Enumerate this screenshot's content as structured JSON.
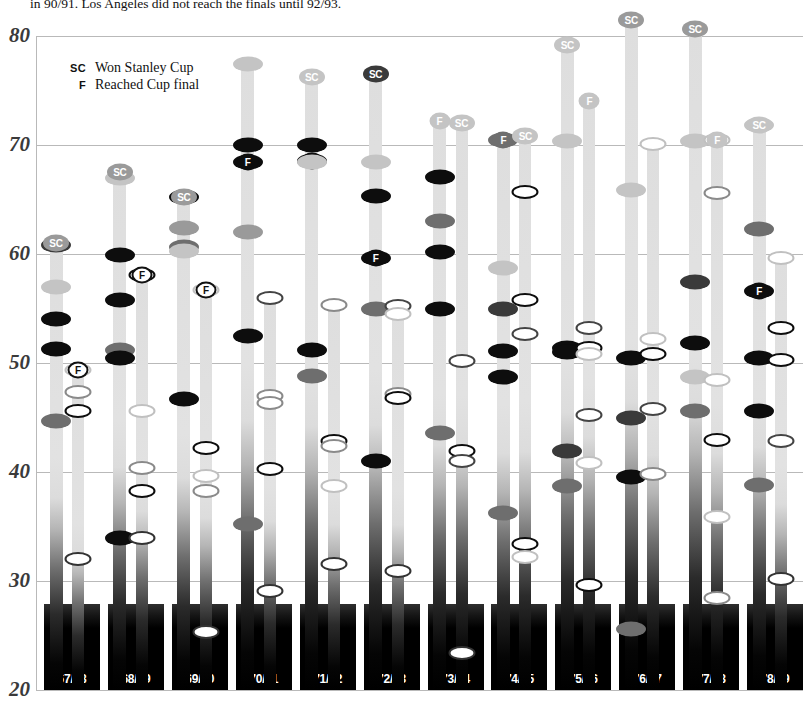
{
  "caption": {
    "line1": "in 90/91. Los Angeles did not reach the finals until 92/93.",
    "line2": ""
  },
  "legend": {
    "items": [
      {
        "key": "SC",
        "label": "Won Stanley Cup"
      },
      {
        "key": "F",
        "label": "Reached Cup final"
      }
    ]
  },
  "chart_data": {
    "type": "scatter",
    "title": "",
    "xlabel": "",
    "ylabel": "",
    "ylim": [
      20,
      80
    ],
    "yticks": [
      20,
      30,
      40,
      50,
      60,
      70,
      80
    ],
    "grid": true,
    "legend_position": "top-left",
    "categories": [
      "67/68",
      "68/69",
      "69/70",
      "70/71",
      "71/72",
      "72/73",
      "73/74",
      "74/75",
      "75/76",
      "76/77",
      "77/78",
      "78/79"
    ],
    "marker_colors": {
      "black": "#0d0d0d",
      "dark": "#3a3a3a",
      "mid": "#6e6e6e",
      "gray": "#9a9a9a",
      "light": "#c4c4c4",
      "open-black": "#0d0d0d",
      "open-dark": "#444444",
      "open-gray": "#8a8a8a",
      "open-light": "#c8c8c8"
    },
    "badges": {
      "sc_won": "SC",
      "f_final": "F"
    },
    "seasons": [
      {
        "label": "67/68",
        "bars": [
          {
            "top": 61.0,
            "badge": "SC",
            "badge_fill": "gray",
            "markers": [
              {
                "v": 60.8,
                "style": "dark"
              },
              {
                "v": 57.0,
                "style": "light"
              },
              {
                "v": 54.0,
                "style": "black"
              },
              {
                "v": 51.3,
                "style": "black"
              },
              {
                "v": 44.7,
                "style": "mid"
              }
            ]
          },
          {
            "top": 49.4,
            "badge": "F",
            "badge_fill": "open",
            "markers": [
              {
                "v": 49.4,
                "style": "open-light"
              },
              {
                "v": 47.3,
                "style": "open-gray"
              },
              {
                "v": 45.6,
                "style": "open-black"
              },
              {
                "v": 32.0,
                "style": "open-white"
              }
            ]
          }
        ]
      },
      {
        "label": "68/69",
        "bars": [
          {
            "top": 67.5,
            "badge": "SC",
            "badge_fill": "gray",
            "markers": [
              {
                "v": 67.0,
                "style": "light"
              },
              {
                "v": 59.9,
                "style": "black"
              },
              {
                "v": 55.8,
                "style": "black"
              },
              {
                "v": 51.2,
                "style": "mid"
              },
              {
                "v": 50.5,
                "style": "black"
              },
              {
                "v": 33.9,
                "style": "black"
              }
            ]
          },
          {
            "top": 58.1,
            "badge": "F",
            "badge_fill": "open",
            "markers": [
              {
                "v": 58.1,
                "style": "open-black"
              },
              {
                "v": 45.6,
                "style": "open-light"
              },
              {
                "v": 40.4,
                "style": "open-gray"
              },
              {
                "v": 38.3,
                "style": "open-black"
              },
              {
                "v": 33.9,
                "style": "open-white"
              }
            ]
          }
        ]
      },
      {
        "label": "69/70",
        "bars": [
          {
            "top": 65.2,
            "badge": "SC",
            "badge_fill": "gray",
            "markers": [
              {
                "v": 65.2,
                "style": "black"
              },
              {
                "v": 62.4,
                "style": "gray"
              },
              {
                "v": 60.6,
                "style": "mid"
              },
              {
                "v": 60.3,
                "style": "light"
              },
              {
                "v": 46.7,
                "style": "black"
              }
            ]
          },
          {
            "top": 56.7,
            "badge": "F",
            "badge_fill": "open",
            "markers": [
              {
                "v": 56.7,
                "style": "open-light"
              },
              {
                "v": 42.2,
                "style": "open-black"
              },
              {
                "v": 39.6,
                "style": "open-light"
              },
              {
                "v": 38.3,
                "style": "open-gray"
              },
              {
                "v": 25.3,
                "style": "open-white"
              }
            ]
          }
        ]
      },
      {
        "label": "70/71",
        "bars": [
          {
            "top": 77.4,
            "badge": "",
            "badge_fill": "",
            "markers": [
              {
                "v": 77.4,
                "style": "light"
              },
              {
                "v": 70.0,
                "style": "black"
              },
              {
                "v": 68.4,
                "style": "black-F"
              },
              {
                "v": 62.0,
                "style": "gray"
              },
              {
                "v": 52.5,
                "style": "black"
              },
              {
                "v": 35.2,
                "style": "mid"
              }
            ]
          },
          {
            "top": 56.0,
            "badge": "",
            "badge_fill": "",
            "markers": [
              {
                "v": 56.0,
                "style": "open-dark"
              },
              {
                "v": 47.0,
                "style": "open-gray"
              },
              {
                "v": 46.3,
                "style": "open-gray"
              },
              {
                "v": 40.3,
                "style": "open-black"
              },
              {
                "v": 29.1,
                "style": "open-white"
              }
            ]
          }
        ]
      },
      {
        "label": "71/72",
        "bars": [
          {
            "top": 76.2,
            "badge": "SC",
            "badge_fill": "light",
            "markers": [
              {
                "v": 70.0,
                "style": "black"
              },
              {
                "v": 68.5,
                "style": "black-F"
              },
              {
                "v": 68.4,
                "style": "light"
              },
              {
                "v": 51.2,
                "style": "black"
              },
              {
                "v": 48.8,
                "style": "mid"
              }
            ]
          },
          {
            "top": 55.3,
            "badge": "",
            "badge_fill": "",
            "markers": [
              {
                "v": 55.3,
                "style": "open-gray"
              },
              {
                "v": 42.8,
                "style": "open-black"
              },
              {
                "v": 42.4,
                "style": "open-gray"
              },
              {
                "v": 38.7,
                "style": "open-light"
              },
              {
                "v": 31.6,
                "style": "open-white"
              }
            ]
          }
        ]
      },
      {
        "label": "72/73",
        "bars": [
          {
            "top": 76.5,
            "badge": "SC",
            "badge_fill": "dark",
            "markers": [
              {
                "v": 68.4,
                "style": "light"
              },
              {
                "v": 65.3,
                "style": "black"
              },
              {
                "v": 59.6,
                "style": "black-F"
              },
              {
                "v": 55.0,
                "style": "mid"
              },
              {
                "v": 41.0,
                "style": "black"
              }
            ]
          },
          {
            "top": 55.2,
            "badge": "",
            "badge_fill": "",
            "markers": [
              {
                "v": 55.2,
                "style": "open-dark"
              },
              {
                "v": 54.5,
                "style": "open-light"
              },
              {
                "v": 47.2,
                "style": "open-gray"
              },
              {
                "v": 46.8,
                "style": "open-black"
              },
              {
                "v": 30.9,
                "style": "open-white"
              }
            ]
          }
        ]
      },
      {
        "label": "73/74",
        "bars": [
          {
            "top": 72.2,
            "badge": "F",
            "badge_fill": "light",
            "markers": [
              {
                "v": 67.1,
                "style": "black"
              },
              {
                "v": 63.0,
                "style": "mid"
              },
              {
                "v": 60.2,
                "style": "black"
              },
              {
                "v": 55.0,
                "style": "black"
              },
              {
                "v": 43.6,
                "style": "mid"
              }
            ]
          },
          {
            "top": 72.0,
            "badge": "SC",
            "badge_fill": "light",
            "markers": [
              {
                "v": 50.2,
                "style": "open-dark"
              },
              {
                "v": 41.9,
                "style": "open-black"
              },
              {
                "v": 41.0,
                "style": "open-dark"
              },
              {
                "v": 23.4,
                "style": "open-white"
              }
            ]
          }
        ]
      },
      {
        "label": "74/75",
        "bars": [
          {
            "top": 70.5,
            "badge": "F",
            "badge_fill": "mid",
            "markers": [
              {
                "v": 70.5,
                "style": "mid"
              },
              {
                "v": 58.7,
                "style": "light"
              },
              {
                "v": 55.0,
                "style": "dark"
              },
              {
                "v": 51.1,
                "style": "black"
              },
              {
                "v": 48.7,
                "style": "black"
              },
              {
                "v": 36.2,
                "style": "mid"
              }
            ]
          },
          {
            "top": 70.8,
            "badge": "SC",
            "badge_fill": "light",
            "markers": [
              {
                "v": 65.7,
                "style": "open-black"
              },
              {
                "v": 55.8,
                "style": "open-black"
              },
              {
                "v": 52.7,
                "style": "open-dark"
              },
              {
                "v": 33.4,
                "style": "open-black"
              },
              {
                "v": 32.2,
                "style": "open-light"
              }
            ]
          }
        ]
      },
      {
        "label": "75/76",
        "bars": [
          {
            "top": 79.2,
            "badge": "SC",
            "badge_fill": "light",
            "markers": [
              {
                "v": 70.4,
                "style": "light"
              },
              {
                "v": 51.4,
                "style": "black"
              },
              {
                "v": 51.0,
                "style": "black"
              },
              {
                "v": 41.9,
                "style": "dark"
              },
              {
                "v": 38.7,
                "style": "mid"
              }
            ]
          },
          {
            "top": 74.0,
            "badge": "F",
            "badge_fill": "light",
            "markers": [
              {
                "v": 53.2,
                "style": "open-dark"
              },
              {
                "v": 51.4,
                "style": "open-black"
              },
              {
                "v": 50.8,
                "style": "open-light"
              },
              {
                "v": 45.2,
                "style": "open-dark"
              },
              {
                "v": 40.8,
                "style": "open-light"
              },
              {
                "v": 29.6,
                "style": "open-black"
              }
            ]
          }
        ]
      },
      {
        "label": "76/77",
        "bars": [
          {
            "top": 81.5,
            "badge": "SC",
            "badge_fill": "gray",
            "markers": [
              {
                "v": 65.9,
                "style": "light"
              },
              {
                "v": 50.5,
                "style": "black"
              },
              {
                "v": 45.0,
                "style": "dark"
              },
              {
                "v": 39.5,
                "style": "black"
              },
              {
                "v": 25.6,
                "style": "mid"
              }
            ]
          },
          {
            "top": 70.1,
            "badge": "",
            "badge_fill": "",
            "markers": [
              {
                "v": 70.1,
                "style": "open-light"
              },
              {
                "v": 52.2,
                "style": "open-light"
              },
              {
                "v": 50.8,
                "style": "open-black"
              },
              {
                "v": 45.8,
                "style": "open-dark"
              },
              {
                "v": 39.8,
                "style": "open-gray"
              }
            ]
          }
        ]
      },
      {
        "label": "77/78",
        "bars": [
          {
            "top": 80.6,
            "badge": "SC",
            "badge_fill": "gray",
            "markers": [
              {
                "v": 70.4,
                "style": "light"
              },
              {
                "v": 57.4,
                "style": "dark"
              },
              {
                "v": 51.8,
                "style": "black"
              },
              {
                "v": 45.6,
                "style": "mid"
              },
              {
                "v": 48.7,
                "style": "light"
              }
            ]
          },
          {
            "top": 70.5,
            "badge": "F",
            "badge_fill": "light",
            "markers": [
              {
                "v": 70.5,
                "style": "open-light"
              },
              {
                "v": 65.6,
                "style": "open-gray"
              },
              {
                "v": 48.4,
                "style": "open-light"
              },
              {
                "v": 42.9,
                "style": "open-black"
              },
              {
                "v": 35.9,
                "style": "open-light"
              },
              {
                "v": 28.4,
                "style": "open-gray"
              }
            ]
          }
        ]
      },
      {
        "label": "78/79",
        "bars": [
          {
            "top": 71.8,
            "badge": "SC",
            "badge_fill": "light",
            "markers": [
              {
                "v": 71.8,
                "style": "light"
              },
              {
                "v": 62.3,
                "style": "mid"
              },
              {
                "v": 56.6,
                "style": "black-F"
              },
              {
                "v": 50.5,
                "style": "black"
              },
              {
                "v": 45.6,
                "style": "black"
              },
              {
                "v": 38.8,
                "style": "mid"
              }
            ]
          },
          {
            "top": 59.6,
            "badge": "",
            "badge_fill": "",
            "markers": [
              {
                "v": 59.6,
                "style": "open-light"
              },
              {
                "v": 53.2,
                "style": "open-black"
              },
              {
                "v": 50.3,
                "style": "open-black"
              },
              {
                "v": 42.8,
                "style": "open-dark"
              },
              {
                "v": 30.2,
                "style": "open-white"
              }
            ]
          }
        ]
      }
    ]
  }
}
